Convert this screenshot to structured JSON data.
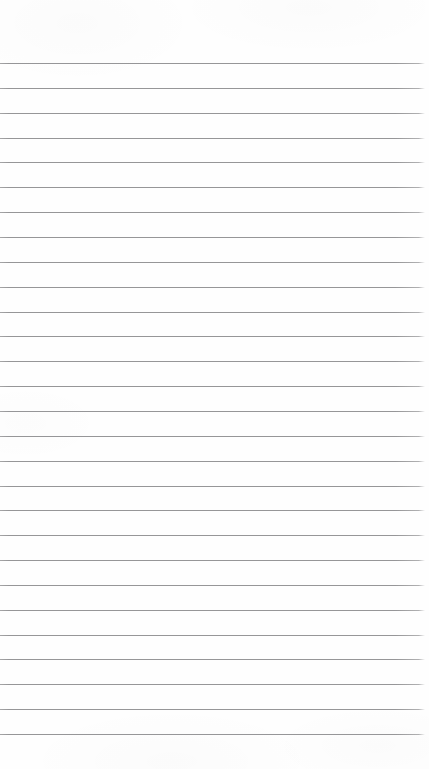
{
  "page": {
    "kind": "ruled-notebook-page",
    "width": 429,
    "height": 769,
    "background_color": "#fefefe",
    "has_text": false,
    "has_ui_chrome": false
  },
  "ruling": {
    "line_color": "#96969a",
    "line_thickness_px": 1,
    "line_count": 28,
    "first_line_y": 63,
    "last_line_y": 734,
    "line_spacing_px": 24.85,
    "line_start_x": 0,
    "line_end_x": 425,
    "top_margin_px": 63,
    "bottom_margin_px": 35,
    "left_margin_px": 0,
    "right_margin_px": 4,
    "line_y_positions": [
      63,
      87.9,
      112.7,
      137.6,
      162.4,
      187.3,
      212.1,
      237,
      261.8,
      286.7,
      311.5,
      336.4,
      361.2,
      386.1,
      410.9,
      435.8,
      460.6,
      485.5,
      510.3,
      535.2,
      560,
      584.9,
      609.7,
      634.6,
      659.4,
      684.3,
      709.1,
      734
    ]
  }
}
